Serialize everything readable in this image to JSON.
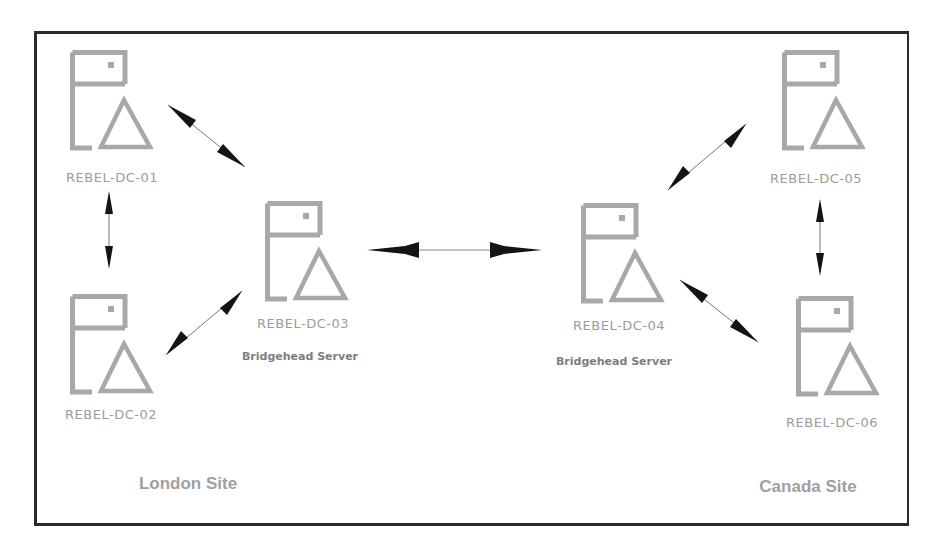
{
  "diagram": {
    "type": "network-topology",
    "colors": {
      "frame": "#2a2a2a",
      "server_icon": "#a8a8a8",
      "server_label": "#9c9c9c",
      "role_label": "#7e7e7e",
      "site_label": "#a0a0a0",
      "arrow": "#1a1a1a"
    },
    "sites": [
      {
        "name": "London Site",
        "servers": [
          "REBEL-DC-01",
          "REBEL-DC-02",
          "REBEL-DC-03"
        ]
      },
      {
        "name": "Canada Site",
        "servers": [
          "REBEL-DC-04",
          "REBEL-DC-05",
          "REBEL-DC-06"
        ]
      }
    ],
    "servers": [
      {
        "name": "REBEL-DC-01",
        "icon": "server-triangle-icon",
        "role": ""
      },
      {
        "name": "REBEL-DC-02",
        "icon": "server-triangle-icon",
        "role": ""
      },
      {
        "name": "REBEL-DC-03",
        "icon": "server-triangle-icon",
        "role": "Bridgehead Server"
      },
      {
        "name": "REBEL-DC-04",
        "icon": "server-triangle-icon",
        "role": "Bridgehead Server"
      },
      {
        "name": "REBEL-DC-05",
        "icon": "server-triangle-icon",
        "role": ""
      },
      {
        "name": "REBEL-DC-06",
        "icon": "server-triangle-icon",
        "role": ""
      }
    ],
    "links": [
      {
        "from": "REBEL-DC-01",
        "to": "REBEL-DC-02",
        "direction": "bidirectional"
      },
      {
        "from": "REBEL-DC-01",
        "to": "REBEL-DC-03",
        "direction": "bidirectional"
      },
      {
        "from": "REBEL-DC-02",
        "to": "REBEL-DC-03",
        "direction": "bidirectional"
      },
      {
        "from": "REBEL-DC-03",
        "to": "REBEL-DC-04",
        "direction": "bidirectional"
      },
      {
        "from": "REBEL-DC-04",
        "to": "REBEL-DC-05",
        "direction": "bidirectional"
      },
      {
        "from": "REBEL-DC-04",
        "to": "REBEL-DC-06",
        "direction": "bidirectional"
      },
      {
        "from": "REBEL-DC-05",
        "to": "REBEL-DC-06",
        "direction": "bidirectional"
      }
    ]
  },
  "labels": {
    "dc01": "REBEL-DC-01",
    "dc02": "REBEL-DC-02",
    "dc03": "REBEL-DC-03",
    "dc04": "REBEL-DC-04",
    "dc05": "REBEL-DC-05",
    "dc06": "REBEL-DC-06",
    "dc03_role": "Bridgehead Server",
    "dc04_role": "Bridgehead Server",
    "london_site": "London Site",
    "canada_site": "Canada Site"
  }
}
